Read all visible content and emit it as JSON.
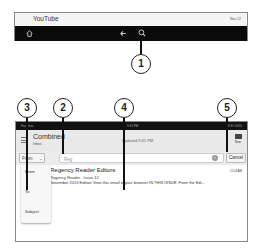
{
  "top_panel": {
    "app_title": "YouTube",
    "date": "Nov 12",
    "nav": {
      "home_icon": "home-icon",
      "back_icon": "back-arrow-icon",
      "search_icon": "search-icon"
    }
  },
  "callouts": [
    {
      "number": "1",
      "target": "search-icon"
    },
    {
      "number": "2",
      "target": "search-input"
    },
    {
      "number": "3",
      "target": "search-field-select"
    },
    {
      "number": "4",
      "target": "search-results"
    },
    {
      "number": "5",
      "target": "cancel-button"
    }
  ],
  "email_app": {
    "status_bar": {
      "left": "Favorites",
      "center": "9:41 PM",
      "right": "Wi-Fi 100%"
    },
    "header": {
      "title": "Combined",
      "subtitle": "Inbox",
      "updated": "Updated 9:41 PM",
      "compose_label": "New"
    },
    "search": {
      "field_select": "From",
      "query": "Reg",
      "cancel_label": "Cancel"
    },
    "field_options": [
      "From",
      "To",
      "Subject"
    ],
    "results": [
      {
        "sender": "Regency Reader Editors",
        "time": "12:01AM",
        "subject": "Regency Reader - Issue 12",
        "preview": "November 2013 Edition View this email in your browser IN THIS ISSUE: From the Edi..."
      }
    ]
  }
}
